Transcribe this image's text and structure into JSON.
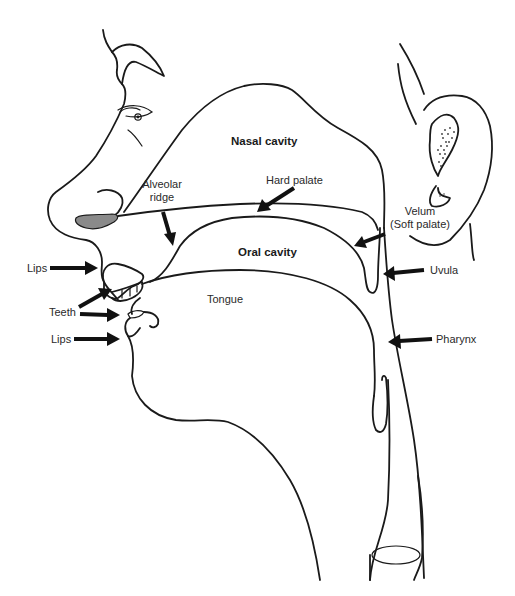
{
  "diagram": {
    "regions": {
      "nasal_cavity": "Nasal cavity",
      "oral_cavity": "Oral cavity",
      "tongue": "Tongue"
    },
    "labels": {
      "alveolar_ridge_line1": "Alveolar",
      "alveolar_ridge_line2": "ridge",
      "hard_palate": "Hard palate",
      "velum_line1": "Velum",
      "velum_line2": "(Soft palate)",
      "uvula": "Uvula",
      "pharynx": "Pharynx",
      "lips_upper": "Lips",
      "teeth": "Teeth",
      "lips_lower": "Lips"
    },
    "colors": {
      "line": "#1a1a1a",
      "arrow": "#111111",
      "nostril_fill": "#8a8a8a",
      "background": "#ffffff"
    }
  }
}
